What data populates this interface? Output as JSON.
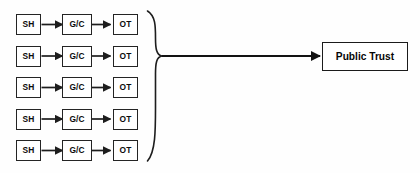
{
  "diagram": {
    "background_color": "#fefefe",
    "stroke_color": "#242424",
    "box_fill_color": "#ffffff",
    "rows": [
      {
        "index": 1,
        "stages": [
          {
            "id": "sh-1",
            "label": "SH"
          },
          {
            "id": "gc-1",
            "label": "G/C"
          },
          {
            "id": "ot-1",
            "label": "OT"
          }
        ]
      },
      {
        "index": 2,
        "stages": [
          {
            "id": "sh-2",
            "label": "SH"
          },
          {
            "id": "gc-2",
            "label": "G/C"
          },
          {
            "id": "ot-2",
            "label": "OT"
          }
        ]
      },
      {
        "index": 3,
        "stages": [
          {
            "id": "sh-3",
            "label": "SH"
          },
          {
            "id": "gc-3",
            "label": "G/C"
          },
          {
            "id": "ot-3",
            "label": "OT"
          }
        ]
      },
      {
        "index": 4,
        "stages": [
          {
            "id": "sh-4",
            "label": "SH"
          },
          {
            "id": "gc-4",
            "label": "G/C"
          },
          {
            "id": "ot-4",
            "label": "OT"
          }
        ]
      },
      {
        "index": 5,
        "stages": [
          {
            "id": "sh-5",
            "label": "SH"
          },
          {
            "id": "gc-5",
            "label": "G/C"
          },
          {
            "id": "ot-5",
            "label": "OT"
          }
        ]
      }
    ],
    "aggregator": {
      "type": "right-curly-brace",
      "label": ""
    },
    "outcome": {
      "id": "public-trust",
      "label": "Public Trust"
    }
  }
}
